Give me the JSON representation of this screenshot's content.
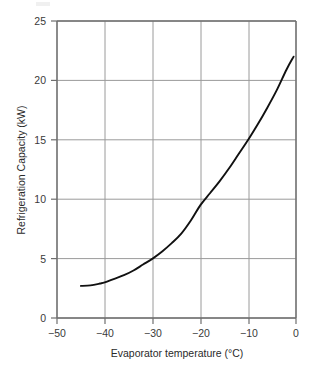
{
  "figure": {
    "background_color": "#ffffff",
    "frame_color": "#7a7a7a",
    "grid_color": "#9a9a9a",
    "curve_color": "#111111",
    "text_color": "#2a2a2a"
  },
  "chart_data": {
    "type": "line",
    "title": "",
    "subtitle": "",
    "xlabel": "Evaporator temperature (°C)",
    "ylabel": "Refrigeration Capacity (kW)",
    "xlim": [
      -50,
      0
    ],
    "ylim": [
      0,
      25
    ],
    "xticks": [
      -50,
      -40,
      -30,
      -20,
      -10,
      0
    ],
    "yticks": [
      0,
      5,
      10,
      15,
      20,
      25
    ],
    "xtick_labels": [
      "−50",
      "−40",
      "−30",
      "−20",
      "−10",
      "0"
    ],
    "ytick_labels": [
      "0",
      "5",
      "10",
      "15",
      "20",
      "25"
    ],
    "grid": true,
    "grid_axes": "both",
    "legend": false,
    "legend_position": "none",
    "series": [
      {
        "name": "Refrigeration capacity",
        "x": [
          -45,
          -43,
          -41,
          -40,
          -38,
          -36,
          -34,
          -32,
          -30,
          -28,
          -26,
          -24,
          -22,
          -20,
          -18,
          -16,
          -14,
          -12,
          -10,
          -8,
          -6,
          -4,
          -2,
          -0.5
        ],
        "values": [
          2.7,
          2.75,
          2.9,
          3.0,
          3.3,
          3.6,
          4.0,
          4.5,
          5.0,
          5.6,
          6.3,
          7.1,
          8.2,
          9.5,
          10.5,
          11.5,
          12.6,
          13.8,
          15.0,
          16.3,
          17.7,
          19.2,
          20.9,
          22.0
        ]
      }
    ],
    "annotations": []
  }
}
